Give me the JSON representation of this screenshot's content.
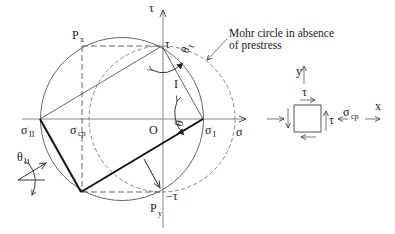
{
  "figure": {
    "type": "Mohr circle diagram with prestress",
    "axes": {
      "sigma_label": "σ",
      "tau_label": "τ",
      "origin_label": "O"
    },
    "points": {
      "tau_top": "τ",
      "tau_bottom": "−τ",
      "px_main": "P",
      "px_sub": "x",
      "py_main": "P",
      "py_sub": "y",
      "sigma_I_main": "σ",
      "sigma_I_sub": "I",
      "sigma_II_main": "σ",
      "sigma_II_sub": "II",
      "sigma_cp_axis_main": "σ",
      "sigma_cp_axis_sub": "cp"
    },
    "angles": {
      "theta_I_main": "θ",
      "theta_I_sub": "I",
      "theta": "θ",
      "line_I_label": "I"
    },
    "annotation": {
      "line1": "Mohr circle in absence",
      "line2": "of prestress"
    },
    "element": {
      "y_label": "y",
      "x_label": "x",
      "tau_top": "τ",
      "tau_right": "τ",
      "sigma_cp_main": "σ",
      "sigma_cp_sub": "cp"
    },
    "colors": {
      "line": "#333333",
      "thick": "#111111",
      "axis": "#777777"
    }
  }
}
